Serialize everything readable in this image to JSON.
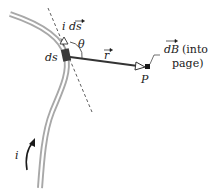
{
  "diagram": {
    "type": "biot-savart-current-element",
    "labels": {
      "current_element": "i ds",
      "theta": "θ",
      "ds": "ds",
      "r_vector": "r",
      "point": "P",
      "field": "dB",
      "field_note_line1": "(into",
      "field_note_line2": "page)",
      "current": "i"
    },
    "colors": {
      "wire": "#c8c8c8",
      "wire_edge": "#9a9a9a",
      "ink": "#1a1a1a",
      "element": "#3a3a3a"
    }
  }
}
